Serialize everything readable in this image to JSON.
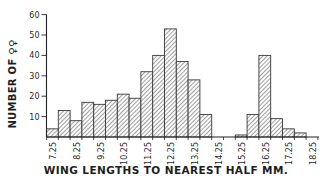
{
  "chart_data": {
    "type": "bar",
    "title": "",
    "xlabel": "WING LENGTHS TO NEAREST HALF MM.",
    "ylabel": "NUMBER OF ♀♀",
    "ylim": [
      0,
      60
    ],
    "yticks": [
      10,
      20,
      30,
      40,
      50,
      60
    ],
    "grid": false,
    "legend": null,
    "bin_width_mm": 0.5,
    "categories": [
      "7.0",
      "7.5",
      "8.0",
      "8.5",
      "9.0",
      "9.5",
      "10.0",
      "10.5",
      "11.0",
      "11.5",
      "12.0",
      "12.5",
      "13.0",
      "13.5",
      "14.0",
      "14.5",
      "15.0",
      "15.5",
      "16.0",
      "16.5",
      "17.0",
      "17.5",
      "18.0"
    ],
    "values": [
      4,
      13,
      8,
      17,
      16,
      18,
      21,
      19,
      32,
      40,
      53,
      37,
      28,
      11,
      0,
      0,
      1,
      11,
      40,
      9,
      4,
      2,
      0
    ],
    "xtick_labels": [
      "7.25",
      "8.25",
      "9.25",
      "10.25",
      "11.25",
      "12.25",
      "13.25",
      "14.25",
      "15.25",
      "16.25",
      "17.25",
      "18.25"
    ],
    "bar_fill": "hatched",
    "bar_color": "#555555"
  },
  "labels": {
    "xlabel": "WING LENGTHS TO NEAREST HALF MM.",
    "ylabel": "NUMBER OF ♀♀"
  }
}
